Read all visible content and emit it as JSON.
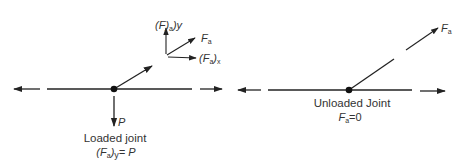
{
  "colors": {
    "stroke": "#222222",
    "text": "#333333",
    "background": "#ffffff"
  },
  "loaded": {
    "caption": "Loaded joint",
    "load_label": "P",
    "equation": {
      "lhs_open": "(F",
      "lhs_sub": "a",
      "lhs_close": ")",
      "lhs_dir": "y",
      "rhs": "= P"
    },
    "components": {
      "y_label": {
        "open": "(F)",
        "sub": "a",
        "close": ")y"
      },
      "resultant_label": {
        "main": "F",
        "sub": "a"
      },
      "x_label": {
        "open": "(F",
        "sub": "a",
        "close": ")",
        "dir": "x"
      }
    }
  },
  "unloaded": {
    "caption": "Unloaded Joint",
    "force_label": {
      "main": "F",
      "sub": "a"
    },
    "equation": {
      "main": "F",
      "sub": "a",
      "rhs": "=0"
    }
  }
}
